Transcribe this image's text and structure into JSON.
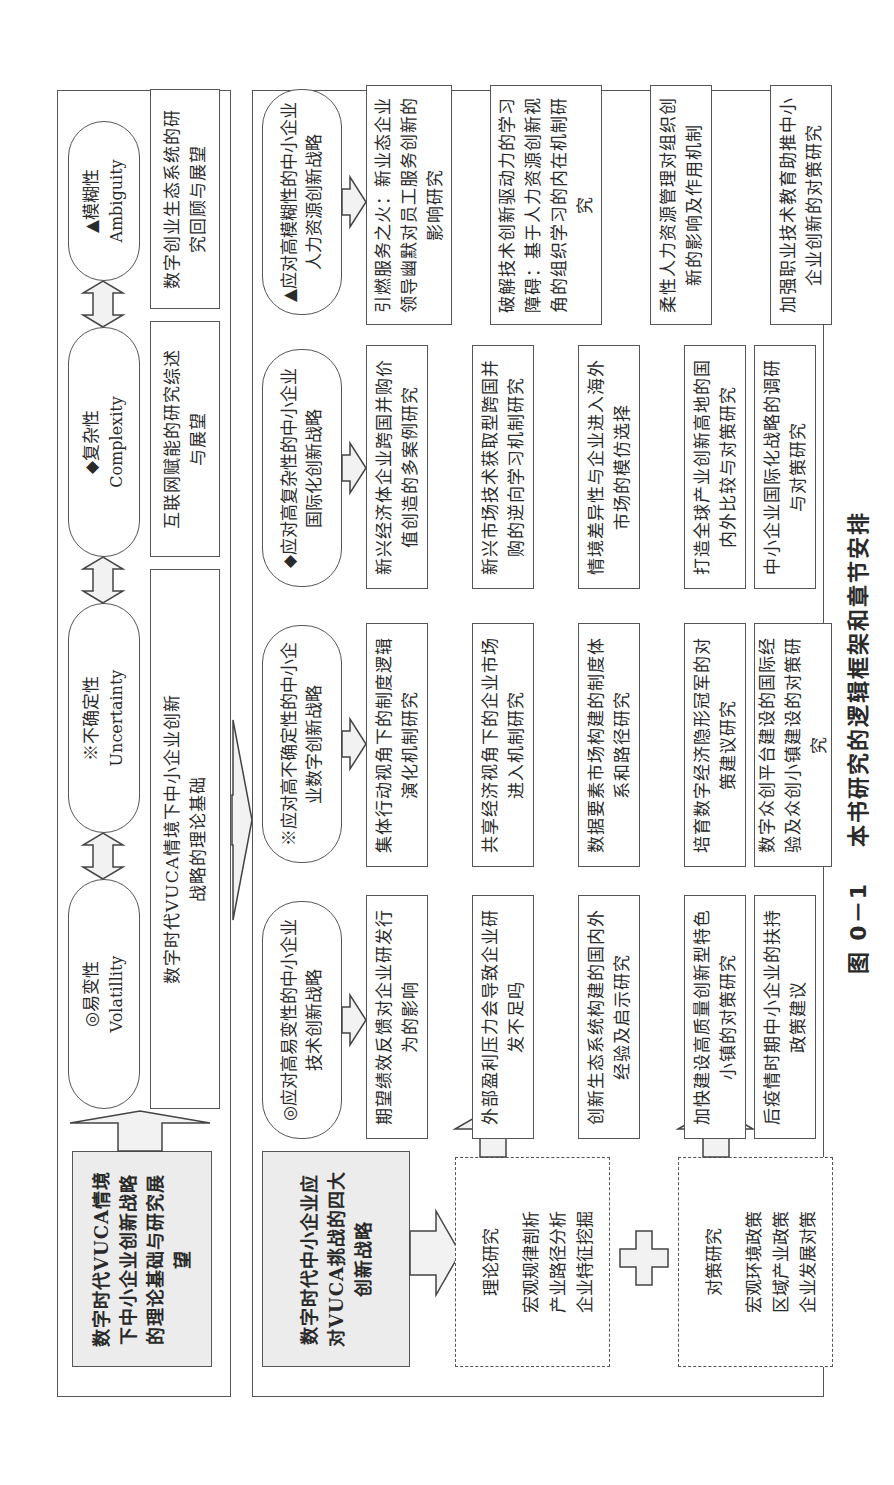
{
  "figure": {
    "caption_number": "图 0－1",
    "caption_title": "本书研究的逻辑框架和章节安排"
  },
  "theory_panel": {
    "summary_box": "数字时代VUCA情境下中小企业创新战略的理论基础与研究展望",
    "dimensions": [
      {
        "symbol": "◎",
        "cn": "易变性",
        "en": "Volatillity"
      },
      {
        "symbol": "※",
        "cn": "不确定性",
        "en": "Uncertainty"
      },
      {
        "symbol": "◆",
        "cn": "复杂性",
        "en": "Complexity"
      },
      {
        "symbol": "▲",
        "cn": "模糊性",
        "en": "Ambiguity"
      }
    ],
    "reviews": [
      "数字时代VUCA情境下中小企业创新战略的理论基础",
      "互联网赋能的研究综述与展望",
      "数字创业生态系统的研究回顾与展望"
    ]
  },
  "strategy_panel": {
    "summary_box": "数字时代中小企业应对VUCA挑战的四大创新战略",
    "theory_research": {
      "title": "理论研究",
      "items": [
        "宏观规律剖析",
        "产业路径分析",
        "企业特征挖掘"
      ]
    },
    "plus_symbol": "+",
    "policy_research": {
      "title": "对策研究",
      "items": [
        "宏观环境政策",
        "区域产业政策",
        "企业发展对策"
      ]
    },
    "strategies": [
      {
        "header": "◎应对高易变性的中小企业技术创新战略",
        "theory_topics": [
          "期望绩效反馈对企业研发行为的影响",
          "外部盈利压力会导致企业研发不足吗",
          "创新生态系统构建的国内外经验及启示研究"
        ],
        "policy_topics": [
          "加快建设高质量创新型特色小镇的对策研究",
          "后疫情时期中小企业的扶持政策建议"
        ]
      },
      {
        "header": "※应对高不确定性的中小企业数字创新战略",
        "theory_topics": [
          "集体行动视角下的制度逻辑演化机制研究",
          "共享经济视角下的企业市场进入机制研究",
          "数据要素市场构建的制度体系和路径研究"
        ],
        "policy_topics": [
          "培育数字经济隐形冠军的对策建议研究",
          "数字众创平台建设的国际经验及众创小镇建设的对策研究"
        ]
      },
      {
        "header": "◆应对高复杂性的中小企业国际化创新战略",
        "theory_topics": [
          "新兴经济体企业跨国并购价值创造的多案例研究",
          "新兴市场技术获取型跨国并购的逆向学习机制研究",
          "情境差异性与企业进入海外市场的模仿选择"
        ],
        "policy_topics": [
          "打造全球产业创新高地的国内外比较与对策研究",
          "中小企业国际化战略的调研与对策研究"
        ]
      },
      {
        "header": "▲应对高模糊性的中小企业人力资源创新战略",
        "theory_topics": [
          "引燃服务之火：新业态企业领导幽默对员工服务创新的影响研究",
          "破解技术创新驱动力的学习障碍：基于人力资源创新视角的组织学习的内在机制研究"
        ],
        "policy_topics": [
          "柔性人力资源管理对组织创新的影响及作用机制",
          "加强职业技术教育助推中小企业创新的对策研究"
        ]
      }
    ]
  }
}
